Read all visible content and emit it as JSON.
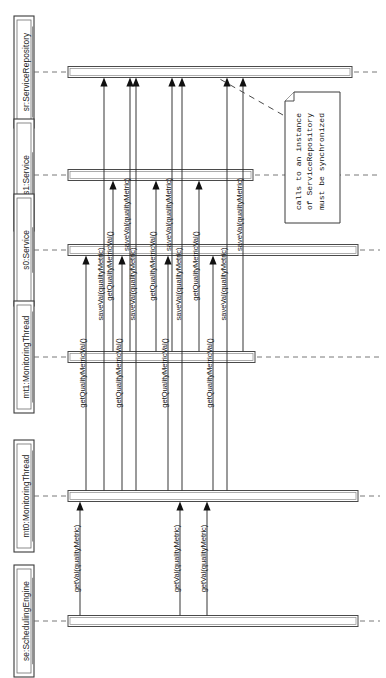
{
  "diagram": {
    "kind": "uml-sequence-diagram",
    "orientation": "rotated-90-counterclockwise",
    "width": 386,
    "height": 678,
    "background": "#ffffff",
    "line_color": "#2a2a2a",
    "box_fill": "#ffffff"
  },
  "lifelines": [
    {
      "id": "sr",
      "label": "sr:ServiceRepository",
      "track": 0,
      "axis": 72,
      "bar_start": 68,
      "bar_end": 352,
      "dash_end": 380
    },
    {
      "id": "s1",
      "label": "s1:Service",
      "track": 1,
      "axis": 175,
      "bar_start": 68,
      "bar_end": 253,
      "dash_end": 380
    },
    {
      "id": "s0",
      "label": "s0:Service",
      "track": 2,
      "axis": 250,
      "bar_start": 68,
      "bar_end": 358,
      "dash_end": 380
    },
    {
      "id": "mt1",
      "label": "mt1:MonitoringThread",
      "track": 3,
      "axis": 357,
      "bar_start": 68,
      "bar_end": 255,
      "dash_end": 380
    },
    {
      "id": "mt0",
      "label": "mt0:MonitoringThread",
      "track": 4,
      "axis": 496,
      "bar_start": 68,
      "bar_end": 358,
      "dash_end": 380
    },
    {
      "id": "se",
      "label": "se:SchedulingEngine",
      "track": 5,
      "axis": 621,
      "bar_start": 68,
      "bar_end": 358,
      "dash_end": 380
    }
  ],
  "messages": [
    {
      "id": "m01",
      "label": "getVal(qualityMetric)",
      "from": "se",
      "to": "mt0",
      "x": 80
    },
    {
      "id": "m02",
      "label": "getVal(qualityMetric)",
      "from": "se",
      "to": "mt0",
      "x": 180
    },
    {
      "id": "m03",
      "label": "getVal(qualityMetric)",
      "from": "se",
      "to": "mt0",
      "x": 207
    },
    {
      "id": "m04",
      "label": "getQualityMetricVal()",
      "from": "mt0",
      "to": "s0",
      "x": 86
    },
    {
      "id": "m05",
      "label": "saveVal(qualityMetric)",
      "from": "mt0",
      "to": "sr",
      "x": 104
    },
    {
      "id": "m06",
      "label": "getQualityMetricVal()",
      "from": "mt0",
      "to": "s0",
      "x": 122
    },
    {
      "id": "m07",
      "label": "saveVal(qualityMetric)",
      "from": "mt0",
      "to": "sr",
      "x": 136
    },
    {
      "id": "m08",
      "label": "getQualityMetricVal()",
      "from": "mt0",
      "to": "s0",
      "x": 168
    },
    {
      "id": "m09",
      "label": "saveVal(qualityMetric)",
      "from": "mt0",
      "to": "sr",
      "x": 182
    },
    {
      "id": "m10",
      "label": "getQualityMetricVal()",
      "from": "mt0",
      "to": "s0",
      "x": 213
    },
    {
      "id": "m11",
      "label": "saveVal(qualityMetric)",
      "from": "mt0",
      "to": "sr",
      "x": 227
    },
    {
      "id": "m12",
      "label": "getQualityMetricVal()",
      "from": "mt1",
      "to": "s1",
      "x": 113
    },
    {
      "id": "m13",
      "label": "saveVal(qualityMetric)",
      "from": "mt1",
      "to": "sr",
      "x": 130
    },
    {
      "id": "m14",
      "label": "getQualityMetricVal()",
      "from": "mt1",
      "to": "s1",
      "x": 156
    },
    {
      "id": "m15",
      "label": "saveVal(qualityMetric)",
      "from": "mt1",
      "to": "sr",
      "x": 172
    },
    {
      "id": "m16",
      "label": "getQualityMetricVal()",
      "from": "mt1",
      "to": "s1",
      "x": 199
    },
    {
      "id": "m17",
      "label": "saveVal(qualityMetric)",
      "from": "mt1",
      "to": "sr",
      "x": 243
    }
  ],
  "note": {
    "id": "sync-note",
    "lines": [
      "calls to an instance",
      "of ServiceRepository",
      "must be synchronized"
    ],
    "text": "calls to an instance of ServiceRepository must be synchronized",
    "box": {
      "x": 285,
      "y": 92,
      "width": 55,
      "height": 131
    },
    "fold_size": 9,
    "anchor": {
      "x1": 283,
      "y1": 115,
      "x2": 218,
      "y2": 78
    }
  }
}
